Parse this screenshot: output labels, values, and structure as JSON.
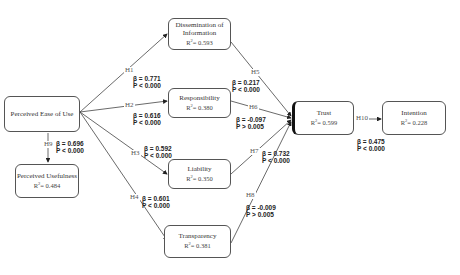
{
  "nodes": {
    "peou": {
      "label": "Perceived Ease of Use",
      "r2": ""
    },
    "pu": {
      "label": "Perceived Usefulness",
      "r2_prefix": "R",
      "r2_value": "= 0.484"
    },
    "dissemination": {
      "label_line1": "Dissemination of",
      "label_line2": "Information",
      "r2_prefix": "R",
      "r2_value": "= 0.593"
    },
    "responsibility": {
      "label": "Responsibility",
      "r2_prefix": "R",
      "r2_value": "= 0.380"
    },
    "liability": {
      "label": "Liability",
      "r2_prefix": "R",
      "r2_value": "= 0.350"
    },
    "transparency": {
      "label": "Transparency",
      "r2_prefix": "R",
      "r2_value": "= 0.381"
    },
    "trust": {
      "label": "Trust",
      "r2_prefix": "R",
      "r2_value": "= 0.599"
    },
    "intention": {
      "label": "Intention",
      "r2_prefix": "R",
      "r2_value": "= 0.228"
    }
  },
  "paths": [
    {
      "id": "H1",
      "from": "Perceived Ease of Use",
      "to": "Dissemination of Information",
      "beta": "β = 0.771",
      "p": "P  < 0.000"
    },
    {
      "id": "H2",
      "from": "Perceived Ease of Use",
      "to": "Responsibility",
      "beta": "β = 0.616",
      "p": "P  < 0.000"
    },
    {
      "id": "H3",
      "from": "Perceived Ease of Use",
      "to": "Liability",
      "beta": "β = 0.592",
      "p": "P  < 0.000"
    },
    {
      "id": "H4",
      "from": "Perceived Ease of Use",
      "to": "Transparency",
      "beta": "β = 0.601",
      "p": "P  < 0.000"
    },
    {
      "id": "H5",
      "from": "Dissemination of Information",
      "to": "Trust",
      "beta": "β = 0.217",
      "p": "P  < 0.000"
    },
    {
      "id": "H6",
      "from": "Responsibility",
      "to": "Trust",
      "beta": "β = -0.097",
      "p": "P  > 0.005"
    },
    {
      "id": "H7",
      "from": "Liability",
      "to": "Trust",
      "beta": "β = 0.732",
      "p": "P  < 0.000"
    },
    {
      "id": "H8",
      "from": "Transparency",
      "to": "Trust",
      "beta": "β = -0.009",
      "p": "P  > 0.005"
    },
    {
      "id": "H9",
      "from": "Perceived Ease of Use",
      "to": "Perceived Usefulness",
      "beta": "β = 0.696",
      "p": "P  < 0.000"
    },
    {
      "id": "H10",
      "from": "Trust",
      "to": "Intention",
      "beta": "β = 0.475",
      "p": "P  < 0.000"
    }
  ]
}
